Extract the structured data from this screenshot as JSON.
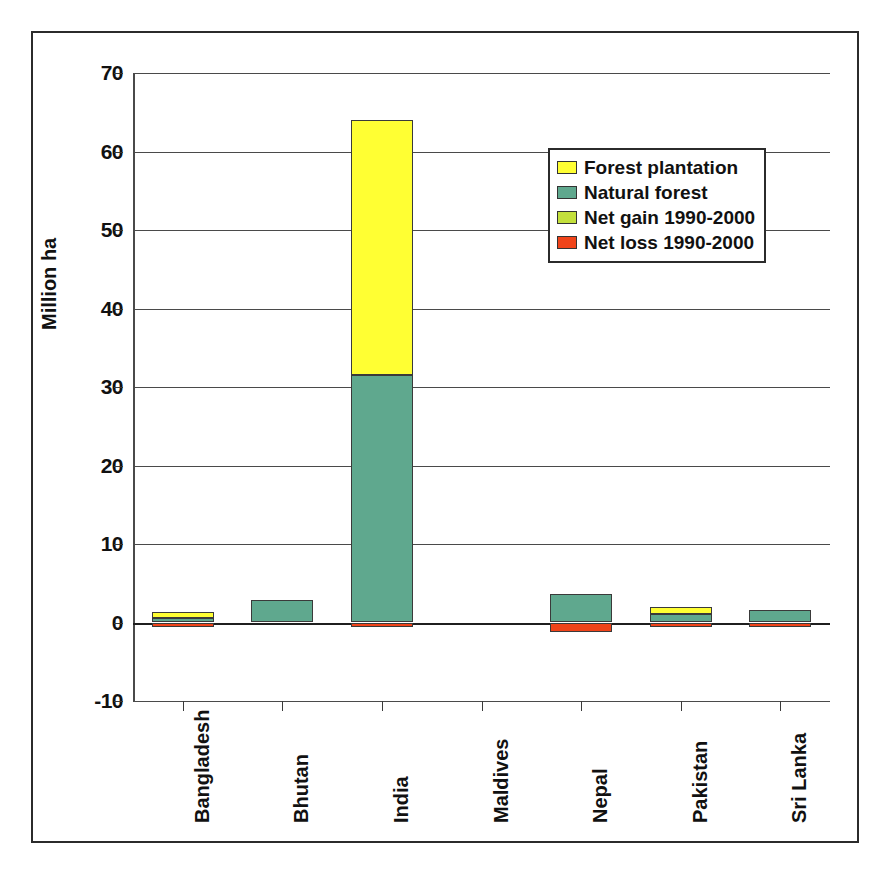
{
  "chart_data": {
    "type": "bar",
    "subtype": "stacked-bar-with-negative",
    "title": "",
    "xlabel": "",
    "ylabel": "Million ha",
    "ylim": [
      -10,
      70
    ],
    "ytick_step": 10,
    "yticks": [
      "70",
      "60",
      "50",
      "40",
      "30",
      "20",
      "10",
      "0",
      "-10"
    ],
    "ytick_values": [
      70,
      60,
      50,
      40,
      30,
      20,
      10,
      0,
      -10
    ],
    "grid": true,
    "grid_axis": "y",
    "legend_position": "upper right inside plot",
    "categories": [
      "Bangladesh",
      "Bhutan",
      "India",
      "Maldives",
      "Nepal",
      "Pakistan",
      "Sri Lanka"
    ],
    "series": [
      {
        "name": "Natural forest",
        "color": "#5fa88e",
        "values": [
          0.63,
          2.9,
          31.5,
          0,
          3.6,
          1.1,
          1.55
        ]
      },
      {
        "name": "Forest plantation",
        "color": "#ffff33",
        "values": [
          0.68,
          0,
          32.5,
          0,
          0,
          0.9,
          0
        ]
      },
      {
        "name": "Net gain 1990-2000",
        "color": "#c3e03c",
        "values": [
          0,
          0,
          0,
          0,
          0,
          0,
          0
        ]
      },
      {
        "name": "Net loss 1990-2000",
        "color": "#f0441a",
        "values": [
          -0.08,
          0,
          -0.12,
          0,
          -1.2,
          -0.2,
          -0.15
        ]
      }
    ],
    "totals": [
      1.31,
      2.9,
      64.0,
      0,
      3.6,
      2.0,
      1.55
    ]
  },
  "legend": {
    "items": [
      {
        "label": "Forest plantation",
        "color": "#ffff33",
        "swatch": "legend-swatch-plantation"
      },
      {
        "label": "Natural forest",
        "color": "#5fa88e",
        "swatch": "legend-swatch-natural"
      },
      {
        "label": "Net gain 1990-2000",
        "color": "#c3e03c",
        "swatch": "legend-swatch-gain"
      },
      {
        "label": "Net loss 1990-2000",
        "color": "#f0441a",
        "swatch": "legend-swatch-loss"
      }
    ]
  },
  "axis": {
    "y_title": "Million ha"
  }
}
